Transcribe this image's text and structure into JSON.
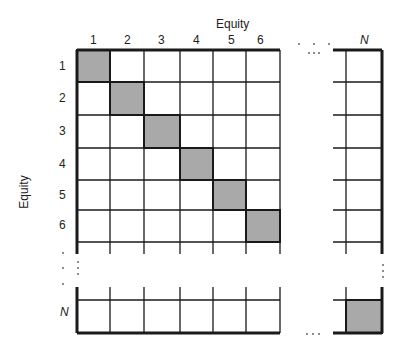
{
  "diagram": {
    "type": "covariance-matrix-grid",
    "top_axis_title": "Equity",
    "left_axis_title": "Equity",
    "column_labels": [
      "1",
      "2",
      "3",
      "4",
      "5",
      "6",
      "N"
    ],
    "row_labels": [
      "1",
      "2",
      "3",
      "4",
      "5",
      "6",
      "N"
    ],
    "ellipsis": "…",
    "shaded_cells": [
      "1,1",
      "2,2",
      "3,3",
      "4,4",
      "5,5",
      "6,6",
      "N,N"
    ],
    "colors": {
      "diagonal_fill": "#a9a9a9",
      "grid_line": "#1a1a1a",
      "background": "#ffffff"
    }
  }
}
